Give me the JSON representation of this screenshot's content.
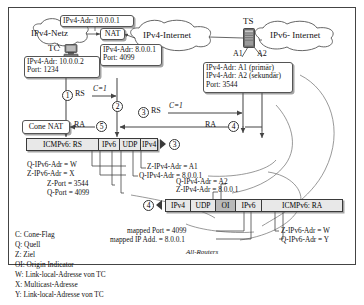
{
  "diagram": {
    "clouds": [
      {
        "id": "ipv4netz",
        "label": "IPv4-Netz"
      },
      {
        "id": "ipv4internet",
        "label": "IPv4-Internet"
      },
      {
        "id": "ipv6internet",
        "label": "IPv6- Internet"
      }
    ],
    "nodes": [
      {
        "id": "tc",
        "label": "TC",
        "icon": "computer-icon"
      },
      {
        "id": "nat",
        "label": "NAT"
      },
      {
        "id": "ts",
        "label": "TS",
        "icon": "server-icon"
      },
      {
        "id": "cone_nat",
        "label": "Cone NAT"
      }
    ],
    "interfaces": [
      {
        "id": "a1",
        "label": "A1"
      },
      {
        "id": "a2",
        "label": "A2"
      }
    ],
    "callouts": [
      {
        "id": "ipv4netz_addr",
        "lines": [
          "IPv4-Adr: 10.0.0.1"
        ]
      },
      {
        "id": "tc_info",
        "lines": [
          "IPv4-Adr: 10.0.0.2",
          "Port: 1234"
        ]
      },
      {
        "id": "nat_info",
        "lines": [
          "IPv4-Adr: 8.0.0.1",
          "Port: 4099"
        ]
      },
      {
        "id": "ts_info",
        "lines": [
          "IPv4-Adr: A1 (primär)",
          "IPv4-Adr: A2 (sekundär)",
          "Port: 3544"
        ]
      }
    ],
    "flows": [
      {
        "id": "step1",
        "number": "1",
        "label": "RS",
        "flag": "C=1"
      },
      {
        "id": "step2",
        "number": "2",
        "label": "",
        "flag": ""
      },
      {
        "id": "step3",
        "number": "3",
        "label": "RS",
        "flag": "C=1"
      },
      {
        "id": "step4",
        "number": "4",
        "label": "RA",
        "flag": ""
      },
      {
        "id": "step5",
        "number": "5",
        "label": "RA",
        "flag": ""
      }
    ],
    "packet_rs": {
      "id": "packet-rs",
      "number": "3",
      "direction": "right",
      "segments": [
        {
          "name": "ICMPv6: RS",
          "shade": "light"
        },
        {
          "name": "IPv6",
          "shade": "light"
        },
        {
          "name": "UDP",
          "shade": "light"
        },
        {
          "name": "IPv4",
          "shade": "light"
        }
      ],
      "annotations": [
        "Q-IPv6-Adr  = W",
        "Z-IPv6-Adr  = X",
        "Z-Port = 3544",
        "Q-Port = 4099",
        "Z-IPv4-Adr = A1",
        "Q-IPv4-Adr  = 8.0.0.1"
      ]
    },
    "packet_ra": {
      "id": "packet-ra",
      "number": "4",
      "direction": "left",
      "segments": [
        {
          "name": "IPv4",
          "shade": "light"
        },
        {
          "name": "UDP",
          "shade": "light"
        },
        {
          "name": "OI",
          "shade": "dark"
        },
        {
          "name": "IPv6",
          "shade": "light"
        },
        {
          "name": "ICMPv6: RA",
          "shade": "light"
        }
      ],
      "annotations": [
        "Z-IPv4-Adr = 8.0.0.1",
        "Q-IPv4-Adr = A2",
        "mapped Port = 4099",
        "mapped IP Add. = 8.0.0.1",
        "Z-IPv6-Adr  = W",
        "Q-IPv6-Adr  = Y"
      ],
      "footnote": "All-Routers"
    },
    "legend": [
      "C: Cone-Flag",
      "Q: Quell",
      "Z: Ziel",
      "OI: Origin Indicator",
      "W: Link-local-Adresse von TC",
      "X: Multicast-Adresse",
      "Y: Link-local-Adresse von TC"
    ],
    "colors": {
      "line": "#555555",
      "packet_bg": "#e8e8e8",
      "packet_dark": "#b9b9b9",
      "frame": "#444444"
    }
  }
}
